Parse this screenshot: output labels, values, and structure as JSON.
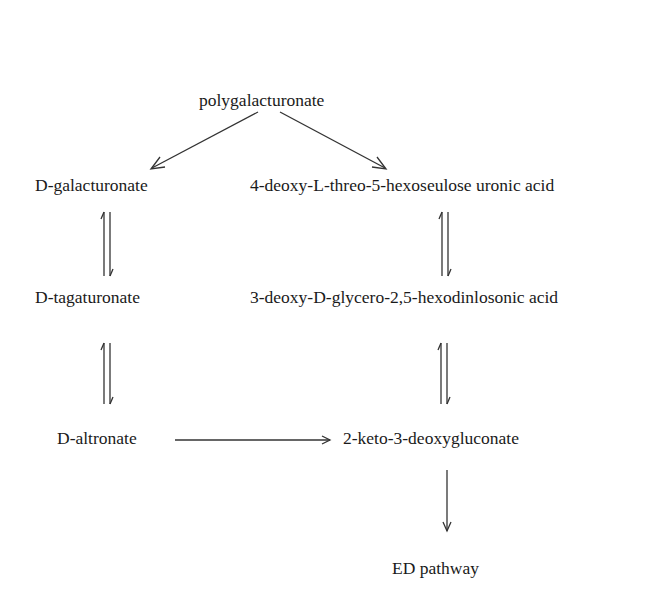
{
  "diagram": {
    "type": "metabolic-pathway",
    "nodes": {
      "top": {
        "text": "polygalacturonate"
      },
      "left1": {
        "prefix": "D",
        "text": "-galacturonate"
      },
      "left2": {
        "prefix": "D",
        "text": "-tagaturonate"
      },
      "left3": {
        "prefix": "D",
        "text": "-altronate"
      },
      "right1": {
        "pre": "4-deoxy-",
        "mid": "L",
        "text": "-threo-5-hexoseulose uronic acid"
      },
      "right2": {
        "pre": "3-deoxy-",
        "mid": "D",
        "text": "-glycero-2,5-hexodinlosonic acid"
      },
      "right3": {
        "text": "2-keto-3-deoxygluconate"
      },
      "bottom": {
        "text": "ED pathway"
      }
    },
    "edges": [
      {
        "from": "polygalacturonate",
        "to": "D-galacturonate",
        "type": "irreversible"
      },
      {
        "from": "polygalacturonate",
        "to": "4-deoxy-L-threo-5-hexoseulose uronic acid",
        "type": "irreversible"
      },
      {
        "from": "D-galacturonate",
        "to": "D-tagaturonate",
        "type": "reversible"
      },
      {
        "from": "D-tagaturonate",
        "to": "D-altronate",
        "type": "reversible"
      },
      {
        "from": "D-altronate",
        "to": "2-keto-3-deoxygluconate",
        "type": "irreversible"
      },
      {
        "from": "4-deoxy-L-threo-5-hexoseulose uronic acid",
        "to": "3-deoxy-D-glycero-2,5-hexodinlosonic acid",
        "type": "reversible"
      },
      {
        "from": "3-deoxy-D-glycero-2,5-hexodinlosonic acid",
        "to": "2-keto-3-deoxygluconate",
        "type": "reversible"
      },
      {
        "from": "2-keto-3-deoxygluconate",
        "to": "ED pathway",
        "type": "irreversible"
      }
    ]
  }
}
